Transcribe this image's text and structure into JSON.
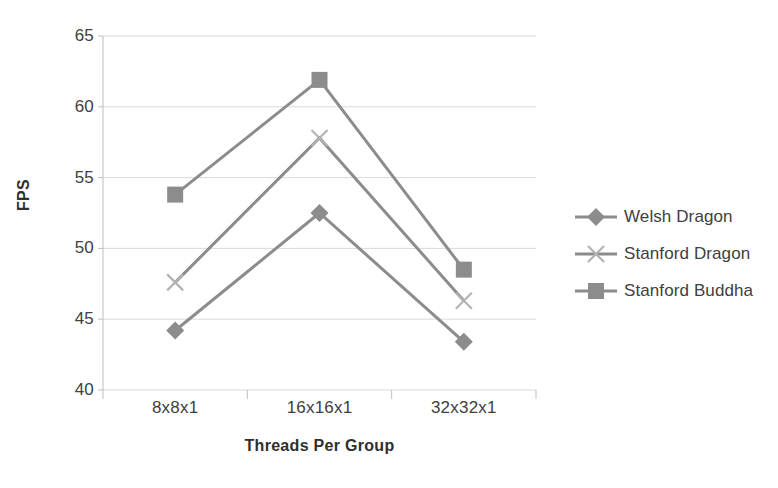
{
  "chart_data": {
    "type": "line",
    "title": "",
    "xlabel": "Threads Per Group",
    "ylabel": "FPS",
    "categories": [
      "8x8x1",
      "16x16x1",
      "32x32x1"
    ],
    "yticks": [
      65,
      60,
      55,
      50,
      45,
      40
    ],
    "ylim": [
      40,
      65
    ],
    "grid": true,
    "legend_position": "right",
    "series": [
      {
        "name": "Welsh Dragon",
        "marker": "diamond",
        "color": "#8c8c8c",
        "values": [
          44.2,
          52.5,
          43.4
        ]
      },
      {
        "name": "Stanford Dragon",
        "marker": "x",
        "color": "#8c8c8c",
        "values": [
          47.6,
          57.8,
          46.3
        ]
      },
      {
        "name": "Stanford Buddha",
        "marker": "square",
        "color": "#8c8c8c",
        "values": [
          53.8,
          61.9,
          48.5
        ]
      }
    ]
  },
  "colors": {
    "line": "#8c8c8c",
    "grid": "#d9d9d9",
    "axis": "#bfbfbf",
    "text": "#404040",
    "background": "#ffffff"
  }
}
